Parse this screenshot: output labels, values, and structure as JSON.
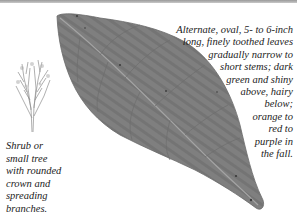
{
  "leaf_description": {
    "lines": [
      "Alternate, oval, 5- to 6-inch",
      "long, finely toothed leaves",
      "gradually narrow to",
      "short stems; dark",
      "green and shiny",
      "above, hairy",
      "below;",
      "orange to",
      "red to",
      "purple in",
      "the fall."
    ]
  },
  "form_description": {
    "lines": [
      "Shrub or",
      "small tree",
      "with rounded",
      "crown and",
      "spreading",
      "branches."
    ]
  },
  "illustrations": {
    "leaf": "leaf-photo",
    "shrub": "shrub-silhouette"
  },
  "colors": {
    "leaf_fill": "#7d7d7d",
    "leaf_vein": "#a9a9a9",
    "text": "#222222",
    "rule": "#9a9a9a"
  }
}
